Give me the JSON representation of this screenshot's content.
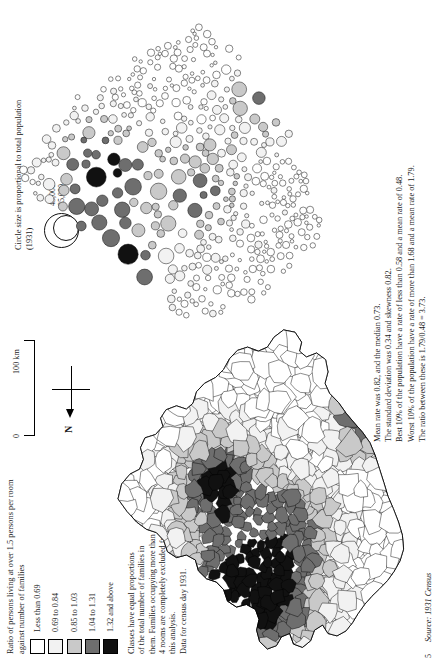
{
  "figure": {
    "page_number": "5",
    "source": "Source: 1931 Census"
  },
  "key": {
    "title": "Ratio of persons living at over 1.5 persons per room against number of families",
    "classes": [
      {
        "label": "Less than 0.69",
        "color": "#ffffff"
      },
      {
        "label": "0.69 to  0.84",
        "color": "#f2f2f2"
      },
      {
        "label": "0.85 to 1.03",
        "color": "#c9c9c9"
      },
      {
        "label": "1.04 to 1.31",
        "color": "#6e6e6e"
      },
      {
        "label": "1.32 and above",
        "color": "#111111"
      }
    ],
    "note_lines": [
      "Classes have equal proportions",
      "of the total number of families in",
      "them. Families occupying more than",
      "4 rooms are completely excluded from",
      "this analysis.",
      "Data for census day 1931."
    ]
  },
  "scale": {
    "zero_label": "0",
    "max_label": "100 km",
    "north_label": "N"
  },
  "circle_key": {
    "title": "Circle size is proportional to total population (1931)",
    "value_small": "45,000",
    "value_large": "85,000"
  },
  "stats": [
    "Mean rate was 0.82, and the median 0.73.",
    "The standard deviation was 0.34 and skewness 0.82.",
    "Best 10% of the population have a rate of less than 0.58 and a mean rate of 0.48.",
    "Worst 10% of the population have a rate of more than 1.68 and a mean rate of 1.79.",
    "The ratio between these is 1.79/0.48 = 3.73."
  ],
  "maps": {
    "choropleth_name": "England and Wales districts choropleth",
    "cartogram_name": "Population circular cartogram"
  },
  "palette": {
    "c1": "#ffffff",
    "c2": "#f2f2f2",
    "c3": "#c9c9c9",
    "c4": "#6e6e6e",
    "c5": "#111111",
    "outline": "#000000"
  }
}
